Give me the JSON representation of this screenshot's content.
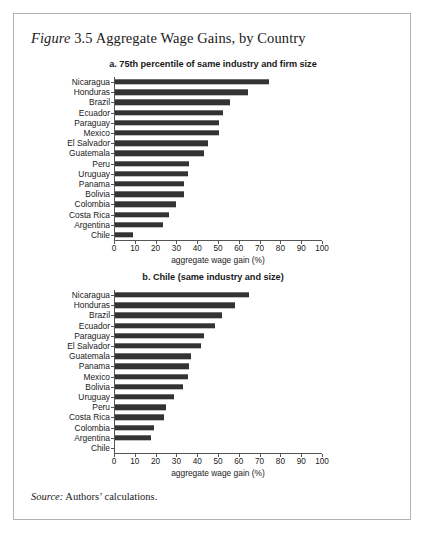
{
  "figure": {
    "label": "Figure",
    "number": "3.5",
    "title": " Aggregate Wage Gains, by Country",
    "source_label": "Source:",
    "source_text": " Authors’ calculations.",
    "border_color": "#b3b3b3",
    "bar_color": "#333333",
    "axis_color": "#555555"
  },
  "chart_data": [
    {
      "type": "bar",
      "orientation": "horizontal",
      "panel": "a",
      "title": "a. 75th percentile of same industry and firm size",
      "xlabel": "aggregate wage gain (%)",
      "ylabel": "",
      "xlim": [
        0,
        100
      ],
      "xticks": [
        0,
        10,
        20,
        30,
        40,
        50,
        60,
        70,
        80,
        90,
        100
      ],
      "xtick_labels": [
        "0",
        "10",
        "20",
        "30",
        "40",
        "50",
        "60",
        "70",
        "80",
        "90",
        "100"
      ],
      "grid": false,
      "legend": "none",
      "categories": [
        "Nicaragua",
        "Honduras",
        "Brazil",
        "Ecuador",
        "Paraguay",
        "Mexico",
        "El Salvador",
        "Guatemala",
        "Peru",
        "Uruguay",
        "Panama",
        "Bolivia",
        "Colombia",
        "Costa Rica",
        "Argentina",
        "Chile"
      ],
      "values": [
        74.5,
        64.5,
        56.0,
        52.5,
        50.5,
        50.5,
        45.0,
        43.5,
        36.0,
        35.5,
        33.5,
        33.5,
        30.0,
        26.5,
        23.5,
        9.0
      ]
    },
    {
      "type": "bar",
      "orientation": "horizontal",
      "panel": "b",
      "title": "b. Chile (same industry and size)",
      "xlabel": "aggregate wage gain (%)",
      "ylabel": "",
      "xlim": [
        0,
        100
      ],
      "xticks": [
        0,
        10,
        20,
        30,
        40,
        50,
        60,
        70,
        80,
        90,
        100
      ],
      "xtick_labels": [
        "0",
        "10",
        "20",
        "30",
        "40",
        "50",
        "60",
        "70",
        "80",
        "90",
        "100"
      ],
      "grid": false,
      "legend": "none",
      "categories": [
        "Nicaragua",
        "Honduras",
        "Brazil",
        "Ecuador",
        "Paraguay",
        "El Salvador",
        "Guatemala",
        "Panama",
        "Mexico",
        "Bolivia",
        "Uruguay",
        "Peru",
        "Costa Rica",
        "Colombia",
        "Argentina",
        "Chile"
      ],
      "values": [
        65.0,
        58.0,
        52.0,
        48.5,
        43.5,
        42.0,
        37.0,
        36.0,
        35.5,
        33.0,
        29.0,
        25.0,
        24.0,
        19.0,
        18.0,
        0.0
      ]
    }
  ]
}
